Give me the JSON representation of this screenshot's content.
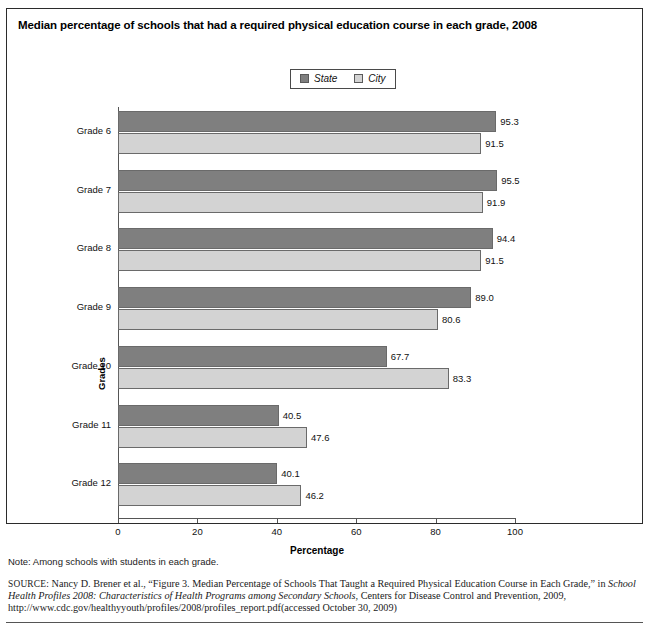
{
  "figure": {
    "title": "Median percentage of schools that had a required physical education course in each grade, 2008",
    "note": "Note: Among schools with students in each grade."
  },
  "legend": {
    "position": "top-center",
    "items": [
      {
        "label": "State",
        "color": "#7f7f7f"
      },
      {
        "label": "City",
        "color": "#d3d3d3"
      }
    ]
  },
  "axes": {
    "x_title": "Percentage",
    "y_title": "Grades",
    "x_ticks": [
      "0",
      "20",
      "40",
      "60",
      "80",
      "100"
    ]
  },
  "source": {
    "label": "SOURCE:",
    "line1_plain": " Nancy D. Brener et al., “Figure 3. Median Percentage of Schools That Taught a Required Physical Education Course in Each Grade,” in ",
    "line1_italic": "School Health Profiles 2008: Characteristics of Health Programs among Secondary Schools",
    "line2_plain": ", Centers for Disease Control and Prevention, 2009, http://www.cdc.gov/healthyyouth/profiles/2008/profiles_report.pdf(accessed October 30, 2009)"
  },
  "chart_data": {
    "type": "bar",
    "orientation": "horizontal",
    "title": "Median percentage of schools that had a required physical education course in each grade, 2008",
    "xlabel": "Percentage",
    "ylabel": "Grades",
    "xlim": [
      0,
      100
    ],
    "grid": false,
    "legend_position": "top-center",
    "categories": [
      "Grade 6",
      "Grade 7",
      "Grade 8",
      "Grade 9",
      "Grade 10",
      "Grade 11",
      "Grade 12"
    ],
    "series": [
      {
        "name": "State",
        "color": "#7f7f7f",
        "values": [
          95.3,
          95.5,
          94.4,
          89.0,
          67.7,
          40.5,
          40.1
        ]
      },
      {
        "name": "City",
        "color": "#d3d3d3",
        "values": [
          91.5,
          91.9,
          91.5,
          80.6,
          83.3,
          47.6,
          46.2
        ]
      }
    ],
    "value_labels": {
      "Grade 6": {
        "State": "95.3",
        "City": "91.5"
      },
      "Grade 7": {
        "State": "95.5",
        "City": "91.9"
      },
      "Grade 8": {
        "State": "94.4",
        "City": "91.5"
      },
      "Grade 9": {
        "State": "89.0",
        "City": "80.6"
      },
      "Grade 10": {
        "State": "67.7",
        "City": "83.3"
      },
      "Grade 11": {
        "State": "40.5",
        "City": "47.6"
      },
      "Grade 12": {
        "State": "40.1",
        "City": "46.2"
      }
    }
  }
}
